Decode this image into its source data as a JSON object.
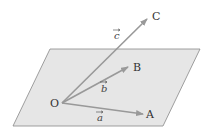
{
  "diagram": {
    "plane": {
      "points": [
        [
          50,
          49
        ],
        [
          200,
          49
        ],
        [
          163,
          126
        ],
        [
          13,
          126
        ]
      ],
      "fill": "#e6e6e6",
      "stroke": "#888888"
    },
    "origin": {
      "label": "O",
      "x": 62,
      "y": 103,
      "label_x": 50,
      "label_y": 107
    },
    "vectors": [
      {
        "name": "a",
        "label": "a",
        "to": "A",
        "tip": [
          143,
          114
        ],
        "point_label_x": 146,
        "point_label_y": 118,
        "vec_label_x": 97,
        "vec_label_y": 121
      },
      {
        "name": "b",
        "label": "b",
        "to": "B",
        "tip": [
          128,
          67
        ],
        "point_label_x": 133,
        "point_label_y": 71,
        "vec_label_x": 101,
        "vec_label_y": 92
      },
      {
        "name": "c",
        "label": "c",
        "to": "C",
        "tip": [
          147,
          19
        ],
        "point_label_x": 152,
        "point_label_y": 20,
        "vec_label_x": 114,
        "vec_label_y": 39
      }
    ],
    "arrow_color": "#999999"
  }
}
